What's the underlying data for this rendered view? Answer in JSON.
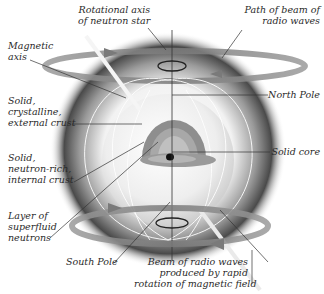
{
  "labels": {
    "rotational_axis": [
      "Rotational axis",
      "of neutron star"
    ],
    "beam_path": [
      "Path of beam of",
      "radio waves"
    ],
    "magnetic_axis": [
      "Magnetic",
      "axis"
    ],
    "external_crust": [
      "Solid,",
      "crystalline,",
      "external crust"
    ],
    "north_pole": "North Pole",
    "solid_core": "Solid core",
    "internal_crust": [
      "Solid,",
      "neutron-rich,",
      "internal crust"
    ],
    "superfluid": [
      "Layer of",
      "superfluid",
      "neutrons"
    ],
    "south_pole": "South Pole",
    "radio_beam": [
      "Beam of radio waves",
      "produced by rapid",
      "rotation of magnetic field"
    ]
  },
  "colors": {
    "text": "#2a2a2a",
    "leader_line": "#333333",
    "ring": "#8a8a8a",
    "halo_dark": "#3a3a3a",
    "core": "#111111",
    "crust": "#8e8e8e"
  }
}
